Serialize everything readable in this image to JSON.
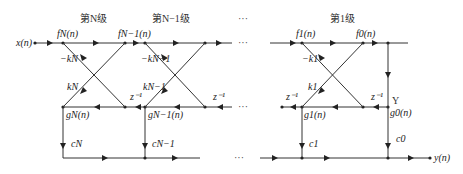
{
  "stages": [
    {
      "title": "第N级",
      "x": 90
    },
    {
      "title": "第N−1级",
      "x": 170
    },
    {
      "title": "第1级",
      "x": 340
    }
  ],
  "top_dots": "···",
  "signals": {
    "input": "x(n)",
    "output": "y(n)",
    "fN": "fN(n)",
    "fN1": "fN−1(n)",
    "f1": "f1(n)",
    "f0": "f0(n)",
    "gN": "gN(n)",
    "gN1": "gN−1(n)",
    "g1": "g1(n)",
    "g0": "g0(n)"
  },
  "coefficients": {
    "neg_kN": "−kN",
    "kN": "kN",
    "neg_kN1": "−kN−1",
    "kN1": "kN−1",
    "neg_k1": "−k1",
    "k1": "k1",
    "cN": "cN",
    "cN1": "cN−1",
    "c1": "c1",
    "c0": "c0"
  },
  "delay": "z⁻¹",
  "y_marker": "Y",
  "ellipsis": "···"
}
